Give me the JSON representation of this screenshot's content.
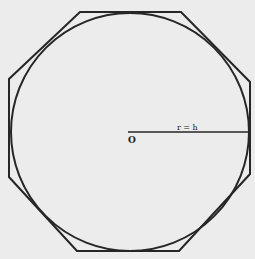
{
  "diagram": {
    "background": "#ececec",
    "stroke_color": "#262626",
    "circle": {
      "cx": 130,
      "cy": 132,
      "r": 119
    },
    "octagon": {
      "points": "80,12 181,12 250,82 250,174 179,251 77,251 9,177 9,79"
    },
    "radius_line": {
      "x1": 128,
      "y1": 132,
      "x2": 249,
      "y2": 132
    },
    "labels": {
      "center": "O",
      "radius": "r = h"
    }
  }
}
